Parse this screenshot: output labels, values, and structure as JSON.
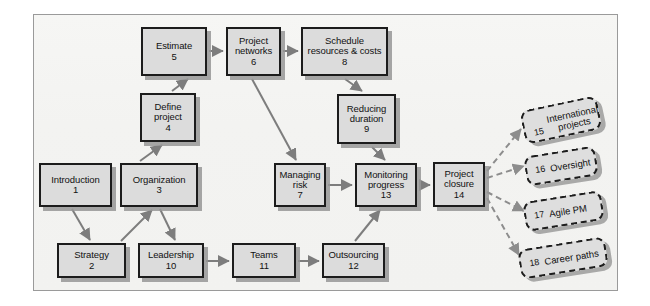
{
  "diagram": {
    "frame": {
      "background": "#f4f4f2",
      "border_color": "#9a9a9a"
    },
    "style": {
      "node_fill": "#dcdcdc",
      "node_border": "#1c1c1c",
      "edge_color": "#7d7d7d",
      "dashed_edge_color": "#8a8a8a"
    },
    "nodes": [
      {
        "id": "n1",
        "label": "Introduction",
        "number": "1",
        "x": 39,
        "y": 163,
        "w": 73,
        "h": 44,
        "type": "solid"
      },
      {
        "id": "n2",
        "label": "Strategy",
        "number": "2",
        "x": 57,
        "y": 243,
        "w": 69,
        "h": 35,
        "type": "solid"
      },
      {
        "id": "n3",
        "label": "Organization",
        "number": "3",
        "x": 120,
        "y": 163,
        "w": 78,
        "h": 44,
        "type": "solid"
      },
      {
        "id": "n4",
        "label": "Define\nproject",
        "number": "4",
        "x": 140,
        "y": 93,
        "w": 56,
        "h": 49,
        "type": "solid"
      },
      {
        "id": "n5",
        "label": "Estimate",
        "number": "5",
        "x": 141,
        "y": 27,
        "w": 66,
        "h": 49,
        "type": "solid"
      },
      {
        "id": "n6",
        "label": "Project\nnetworks",
        "number": "6",
        "x": 226,
        "y": 27,
        "w": 55,
        "h": 49,
        "type": "solid"
      },
      {
        "id": "n7",
        "label": "Managing\nrisk",
        "number": "7",
        "x": 274,
        "y": 163,
        "w": 52,
        "h": 44,
        "type": "solid"
      },
      {
        "id": "n8",
        "label": "Schedule\nresources & costs",
        "number": "8",
        "x": 301,
        "y": 27,
        "w": 87,
        "h": 49,
        "type": "solid"
      },
      {
        "id": "n9",
        "label": "Reducing\nduration",
        "number": "9",
        "x": 337,
        "y": 94,
        "w": 59,
        "h": 50,
        "type": "solid"
      },
      {
        "id": "n10",
        "label": "Leadership",
        "number": "10",
        "x": 138,
        "y": 243,
        "w": 66,
        "h": 35,
        "type": "solid"
      },
      {
        "id": "n11",
        "label": "Teams",
        "number": "11",
        "x": 232,
        "y": 243,
        "w": 64,
        "h": 35,
        "type": "solid"
      },
      {
        "id": "n12",
        "label": "Outsourcing",
        "number": "12",
        "x": 322,
        "y": 243,
        "w": 63,
        "h": 35,
        "type": "solid"
      },
      {
        "id": "n13",
        "label": "Monitoring\nprogress",
        "number": "13",
        "x": 355,
        "y": 163,
        "w": 62,
        "h": 44,
        "type": "solid"
      },
      {
        "id": "n14",
        "label": "Project\nclosure",
        "number": "14",
        "x": 433,
        "y": 162,
        "w": 52,
        "h": 45,
        "type": "solid"
      }
    ],
    "dashed_nodes": [
      {
        "id": "d15",
        "label": "International projects",
        "number": "15",
        "x": 522,
        "y": 103,
        "w": 78,
        "h": 34,
        "rotate": -12,
        "wrapped": true,
        "line1": "International",
        "line2": "projects"
      },
      {
        "id": "d16",
        "label": "Oversight",
        "number": "16",
        "x": 525,
        "y": 151,
        "w": 72,
        "h": 30,
        "rotate": -9,
        "wrapped": false
      },
      {
        "id": "d17",
        "label": "Agile PM",
        "number": "17",
        "x": 524,
        "y": 196,
        "w": 79,
        "h": 30,
        "rotate": -9,
        "wrapped": false
      },
      {
        "id": "d18",
        "label": "Career paths",
        "number": "18",
        "x": 519,
        "y": 243,
        "w": 88,
        "h": 30,
        "rotate": -9,
        "wrapped": false
      }
    ],
    "edges": [
      {
        "from": "n1",
        "to": "n2",
        "kind": "solid"
      },
      {
        "from": "n2",
        "to": "n3",
        "kind": "solid"
      },
      {
        "from": "n3",
        "to": "n4",
        "kind": "solid"
      },
      {
        "from": "n3",
        "to": "n10",
        "kind": "solid"
      },
      {
        "from": "n4",
        "to": "n5",
        "kind": "solid"
      },
      {
        "from": "n5",
        "to": "n6",
        "kind": "solid"
      },
      {
        "from": "n6",
        "to": "n8",
        "kind": "solid"
      },
      {
        "from": "n6",
        "to": "n7",
        "kind": "solid"
      },
      {
        "from": "n8",
        "to": "n9",
        "kind": "solid"
      },
      {
        "from": "n9",
        "to": "n13",
        "kind": "solid"
      },
      {
        "from": "n7",
        "to": "n13",
        "kind": "solid"
      },
      {
        "from": "n13",
        "to": "n14",
        "kind": "solid"
      },
      {
        "from": "n10",
        "to": "n11",
        "kind": "solid"
      },
      {
        "from": "n11",
        "to": "n12",
        "kind": "solid"
      },
      {
        "from": "n12",
        "to": "n13",
        "kind": "solid"
      },
      {
        "from": "n14",
        "to": "d15",
        "kind": "dashed"
      },
      {
        "from": "n14",
        "to": "d16",
        "kind": "dashed"
      },
      {
        "from": "n14",
        "to": "d17",
        "kind": "dashed"
      },
      {
        "from": "n14",
        "to": "d18",
        "kind": "dashed"
      }
    ]
  }
}
